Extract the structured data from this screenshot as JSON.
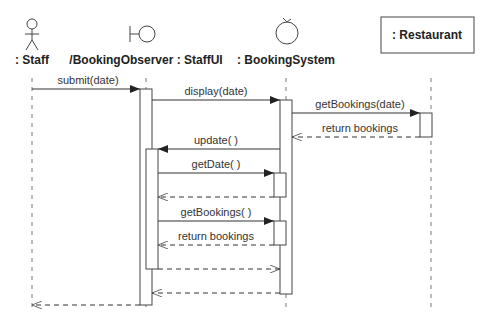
{
  "diagram": {
    "type": "sequence",
    "participants": [
      {
        "id": "staff",
        "label": ": Staff",
        "kind": "actor"
      },
      {
        "id": "staffui",
        "label": "/BookingObserver : StaffUI",
        "kind": "boundary"
      },
      {
        "id": "bookingsystem",
        "label": ": BookingSystem",
        "kind": "control"
      },
      {
        "id": "restaurant",
        "label": ": Restaurant",
        "kind": "object"
      }
    ],
    "messages": [
      {
        "from": "staff",
        "to": "staffui",
        "label": "submit(date)",
        "style": "sync"
      },
      {
        "from": "staffui",
        "to": "bookingsystem",
        "label": "display(date)",
        "style": "sync"
      },
      {
        "from": "bookingsystem",
        "to": "restaurant",
        "label": "getBookings(date)",
        "style": "sync"
      },
      {
        "from": "restaurant",
        "to": "bookingsystem",
        "label": "return bookings",
        "style": "return"
      },
      {
        "from": "bookingsystem",
        "to": "staffui",
        "label": "update( )",
        "style": "sync"
      },
      {
        "from": "staffui",
        "to": "bookingsystem",
        "label": "getDate( )",
        "style": "sync"
      },
      {
        "from": "bookingsystem",
        "to": "staffui",
        "label": "",
        "style": "return"
      },
      {
        "from": "staffui",
        "to": "bookingsystem",
        "label": "getBookings( )",
        "style": "sync"
      },
      {
        "from": "bookingsystem",
        "to": "staffui",
        "label": "return bookings",
        "style": "return"
      },
      {
        "from": "staffui",
        "to": "bookingsystem",
        "label": "",
        "style": "return"
      },
      {
        "from": "bookingsystem",
        "to": "staffui",
        "label": "",
        "style": "return"
      },
      {
        "from": "staffui",
        "to": "staff",
        "label": "",
        "style": "return"
      }
    ]
  }
}
